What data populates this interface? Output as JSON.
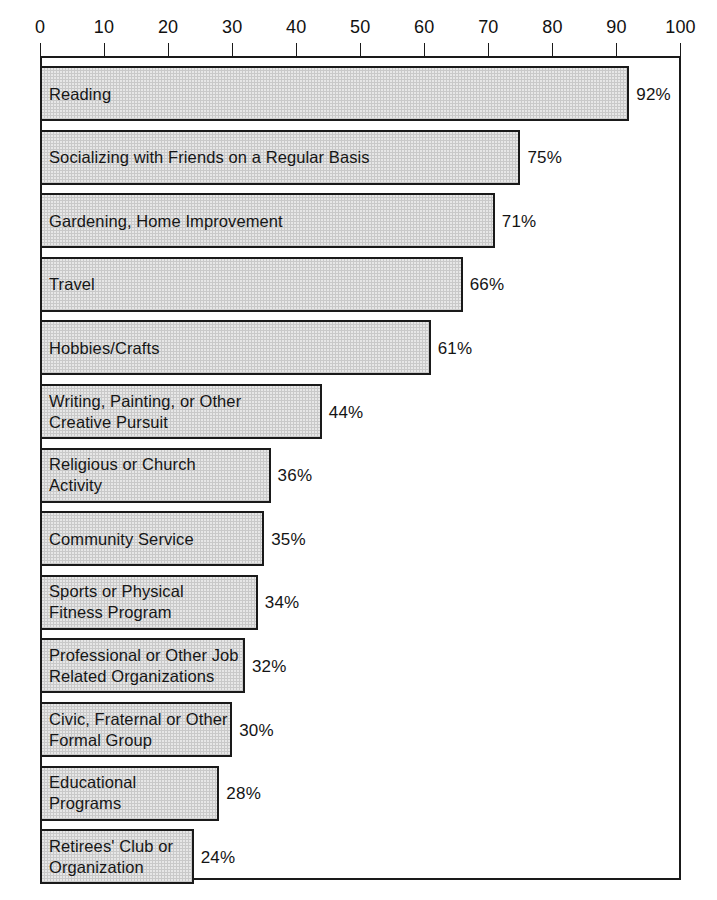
{
  "chart_data": {
    "type": "bar",
    "orientation": "horizontal",
    "title": "",
    "subtitle": "",
    "xlabel": "",
    "ylabel": "",
    "xlim": [
      0,
      100
    ],
    "grid": false,
    "legend": null,
    "value_suffix": "%",
    "axis": {
      "ticks": [
        0,
        10,
        20,
        30,
        40,
        50,
        60,
        70,
        80,
        90,
        100
      ],
      "tick_labels": [
        "0",
        "10",
        "20",
        "30",
        "40",
        "50",
        "60",
        "70",
        "80",
        "90",
        "100"
      ],
      "position": "top"
    },
    "categories": [
      "Reading",
      "Socializing with Friends on a Regular Basis",
      "Gardening, Home Improvement",
      "Travel",
      "Hobbies/Crafts",
      "Writing, Painting, or Other Creative Pursuit",
      "Religious or Church Activity",
      "Community Service",
      "Sports or Physical Fitness Program",
      "Professional or Other Job Related Organizations",
      "Civic, Fraternal or Other Formal Group",
      "Educational Programs",
      "Retirees' Club or Organization"
    ],
    "values": [
      92,
      75,
      71,
      66,
      61,
      44,
      36,
      35,
      34,
      32,
      30,
      28,
      24
    ],
    "value_labels": [
      "92%",
      "75%",
      "71%",
      "66%",
      "61%",
      "44%",
      "36%",
      "35%",
      "34%",
      "32%",
      "30%",
      "28%",
      "24%"
    ],
    "bars": [
      {
        "label": "Reading",
        "label_lines": [
          "Reading"
        ],
        "value": 92,
        "value_label": "92%"
      },
      {
        "label": "Socializing with Friends on a Regular Basis",
        "label_lines": [
          "Socializing with Friends on a Regular Basis"
        ],
        "value": 75,
        "value_label": "75%"
      },
      {
        "label": "Gardening, Home Improvement",
        "label_lines": [
          "Gardening, Home Improvement"
        ],
        "value": 71,
        "value_label": "71%"
      },
      {
        "label": "Travel",
        "label_lines": [
          "Travel"
        ],
        "value": 66,
        "value_label": "66%"
      },
      {
        "label": "Hobbies/Crafts",
        "label_lines": [
          "Hobbies/Crafts"
        ],
        "value": 61,
        "value_label": "61%"
      },
      {
        "label": "Writing, Painting, or Other Creative Pursuit",
        "label_lines": [
          "Writing, Painting, or Other",
          "Creative Pursuit"
        ],
        "value": 44,
        "value_label": "44%"
      },
      {
        "label": "Religious or Church Activity",
        "label_lines": [
          "Religious or Church",
          "Activity"
        ],
        "value": 36,
        "value_label": "36%"
      },
      {
        "label": "Community Service",
        "label_lines": [
          "Community Service"
        ],
        "value": 35,
        "value_label": "35%"
      },
      {
        "label": "Sports or Physical Fitness Program",
        "label_lines": [
          "Sports or Physical",
          "Fitness Program"
        ],
        "value": 34,
        "value_label": "34%"
      },
      {
        "label": "Professional or Other Job Related Organizations",
        "label_lines": [
          "Professional or Other Job",
          "Related Organizations"
        ],
        "value": 32,
        "value_label": "32%"
      },
      {
        "label": "Civic, Fraternal or Other Formal Group",
        "label_lines": [
          "Civic, Fraternal or Other",
          "Formal Group"
        ],
        "value": 30,
        "value_label": "30%"
      },
      {
        "label": "Educational Programs",
        "label_lines": [
          "Educational",
          "Programs"
        ],
        "value": 28,
        "value_label": "28%"
      },
      {
        "label": "Retirees' Club or Organization",
        "label_lines": [
          "Retirees' Club or",
          "Organization"
        ],
        "value": 24,
        "value_label": "24%"
      }
    ]
  },
  "colors": {
    "bar_fill": "#c9c9c9",
    "bar_stroke": "#1a1a1a",
    "frame": "#1a1a1a",
    "text": "#161616",
    "background": "#ffffff"
  }
}
